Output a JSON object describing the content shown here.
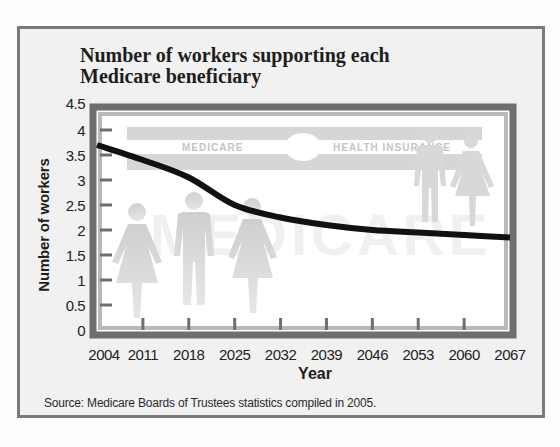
{
  "chart_data": {
    "type": "line",
    "title": "Number of workers supporting each Medicare beneficiary",
    "title_lines": [
      "Number of workers supporting each",
      "Medicare beneficiary"
    ],
    "xlabel": "Year",
    "ylabel": "Number of workers",
    "x": [
      2004,
      2011,
      2018,
      2025,
      2032,
      2039,
      2046,
      2053,
      2060,
      2067
    ],
    "series": [
      {
        "name": "Workers per beneficiary",
        "values": [
          3.7,
          3.4,
          3.05,
          2.5,
          2.25,
          2.1,
          2.0,
          1.95,
          1.9,
          1.85
        ]
      }
    ],
    "xticks": [
      "2004",
      "2011",
      "2018",
      "2025",
      "2032",
      "2039",
      "2046",
      "2053",
      "2060",
      "2067"
    ],
    "yticks": [
      "0",
      "0.5",
      "1",
      "1.5",
      "2",
      "2.5",
      "3",
      "3.5",
      "4",
      "4.5"
    ],
    "ylim": [
      0,
      4.5
    ],
    "grid": false,
    "legend": null,
    "annotations": [
      "MEDICARE",
      "HEALTH INSURANCE",
      "MEDICARE"
    ],
    "source": "Source: Medicare Boards of Trustees statistics compiled in 2005."
  },
  "background_art": {
    "card_left_text": "MEDICARE",
    "card_right_text": "HEALTH INSURANCE",
    "watermark_text": "MEDICARE"
  },
  "colors": {
    "frame": "#7a7a7a",
    "panel": "#f1f1f1",
    "plot_bg": "#ffffff",
    "line": "#111111",
    "silhouette": "#d4d4d4"
  }
}
